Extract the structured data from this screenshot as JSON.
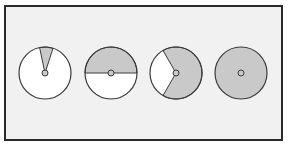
{
  "figure": {
    "colors": {
      "shaded": "#c9c9c9",
      "unshaded": "#ffffff",
      "outline": "#3a3a3a",
      "background": "#f1f1f1",
      "frame": "#2a2a2a"
    },
    "circles": [
      {
        "name": "circle-1",
        "shaded_start_deg": -12,
        "shaded_end_deg": 18
      },
      {
        "name": "circle-2",
        "shaded_start_deg": -90,
        "shaded_end_deg": 90
      },
      {
        "name": "circle-3",
        "shaded_start_deg": -30,
        "shaded_end_deg": 210
      },
      {
        "name": "circle-4",
        "shaded_start_deg": 0,
        "shaded_end_deg": 360
      }
    ]
  }
}
